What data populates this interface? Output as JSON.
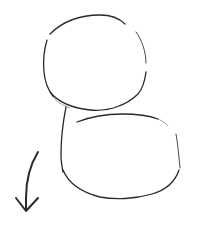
{
  "canvas": {
    "background": "#ffffff",
    "ink_color": "#2a2a2a"
  },
  "drawing": {
    "subject": "hand-drawn pencil sketch",
    "shapes": [
      {
        "id": "head",
        "kind": "circle",
        "description": "rough circle on top"
      },
      {
        "id": "body",
        "kind": "rounded-box",
        "description": "rounded body shape overlapping below the head"
      },
      {
        "id": "arrow",
        "kind": "curved-arrow",
        "description": "curved arrow pointing downward at lower-left"
      }
    ]
  }
}
